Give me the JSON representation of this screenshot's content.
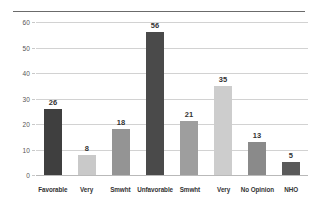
{
  "chart_data": {
    "type": "bar",
    "title": "",
    "subtitle": "",
    "xlabel": "",
    "ylabel": "",
    "ylim": [
      0,
      60
    ],
    "yticks": [
      0,
      10,
      20,
      30,
      40,
      50,
      60
    ],
    "grid": true,
    "legend": false,
    "categories": [
      "Favorable",
      "Very",
      "Smwht",
      "Unfavorable",
      "Smwht",
      "Very",
      "No Opinion",
      "NHO"
    ],
    "values": [
      26,
      8,
      18,
      56,
      21,
      35,
      13,
      5
    ],
    "value_labels": [
      "26",
      "8",
      "18",
      "56",
      "21",
      "35",
      "13",
      "5"
    ],
    "bar_colors": [
      "#3f3f3f",
      "#c9c9c9",
      "#949494",
      "#4a4a4a",
      "#9e9e9e",
      "#cdcdcd",
      "#8a8a8a",
      "#5a5a5a"
    ],
    "ytick_labels": [
      "0",
      "10",
      "20",
      "30",
      "40",
      "50",
      "60"
    ]
  },
  "style": {
    "background": "#ffffff",
    "gridline_color": "#d2d2d2",
    "top_rule_color": "#6b6b6b",
    "label_color": "#333333",
    "tick_color": "#555555"
  }
}
